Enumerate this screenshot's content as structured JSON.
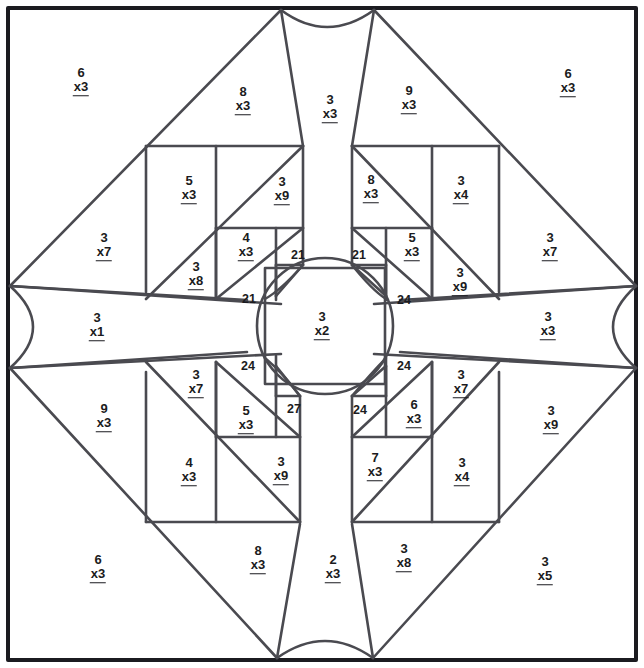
{
  "worksheet": {
    "title": "Multiplication Colour-by-Number Mosaic",
    "type": "color-by-number-puzzle",
    "canvas": {
      "width": 644,
      "height": 668
    },
    "colors": {
      "line": "#4a4a50",
      "border": "#1b1b20",
      "text": "#1b1b20",
      "background": "#ffffff"
    }
  },
  "regions": [
    {
      "id": "r01",
      "name": "top-left-corner-triangle",
      "top": "6",
      "bottom": "x3",
      "x": 81,
      "y": 81
    },
    {
      "id": "r02",
      "name": "top-left-inner-triangle",
      "top": "8",
      "bottom": "x3",
      "x": 243,
      "y": 100
    },
    {
      "id": "r03",
      "name": "top-center-left-petal",
      "top": "3",
      "bottom": "x3",
      "x": 330,
      "y": 108
    },
    {
      "id": "r04",
      "name": "top-right-inner-triangle",
      "top": "9",
      "bottom": "x3",
      "x": 409,
      "y": 99
    },
    {
      "id": "r05",
      "name": "top-right-corner-triangle",
      "top": "6",
      "bottom": "x3",
      "x": 568,
      "y": 82
    },
    {
      "id": "r06",
      "name": "upper-left-square-large",
      "top": "5",
      "bottom": "x3",
      "x": 189,
      "y": 189
    },
    {
      "id": "r07",
      "name": "upper-left-diag-strip",
      "top": "3",
      "bottom": "x9",
      "x": 282,
      "y": 190
    },
    {
      "id": "r08",
      "name": "upper-right-strip",
      "top": "8",
      "bottom": "x3",
      "x": 371,
      "y": 188
    },
    {
      "id": "r09",
      "name": "upper-right-square-large",
      "top": "3",
      "bottom": "x4",
      "x": 461,
      "y": 189
    },
    {
      "id": "r10",
      "name": "left-outer-triangle",
      "top": "3",
      "bottom": "x7",
      "x": 104,
      "y": 246
    },
    {
      "id": "r11",
      "name": "upper-left-square-mid",
      "top": "4",
      "bottom": "x3",
      "x": 246,
      "y": 246
    },
    {
      "id": "r12",
      "name": "upper-left-triangle-small",
      "top": "3",
      "bottom": "x8",
      "x": 196,
      "y": 275
    },
    {
      "id": "r13",
      "name": "upper-right-square-mid",
      "top": "5",
      "bottom": "x3",
      "x": 412,
      "y": 246
    },
    {
      "id": "r14",
      "name": "right-outer-triangle",
      "top": "3",
      "bottom": "x7",
      "x": 550,
      "y": 246
    },
    {
      "id": "r15",
      "name": "upper-right-triangle-small",
      "top": "3",
      "bottom": "x9",
      "x": 460,
      "y": 281
    },
    {
      "id": "r16",
      "name": "left-half-circle-band",
      "top": "3",
      "bottom": "x1",
      "x": 97,
      "y": 326
    },
    {
      "id": "r17",
      "name": "center-circle",
      "top": "3",
      "bottom": "x2",
      "x": 322,
      "y": 325
    },
    {
      "id": "r18",
      "name": "right-half-circle-band",
      "top": "3",
      "bottom": "x3",
      "x": 548,
      "y": 325
    },
    {
      "id": "r19",
      "name": "lower-left-triangle-small",
      "top": "3",
      "bottom": "x7",
      "x": 196,
      "y": 383
    },
    {
      "id": "r20",
      "name": "lower-right-triangle-small",
      "top": "3",
      "bottom": "x7",
      "x": 461,
      "y": 383
    },
    {
      "id": "r21",
      "name": "lower-left-square-mid",
      "top": "5",
      "bottom": "x3",
      "x": 246,
      "y": 419
    },
    {
      "id": "r22",
      "name": "lower-right-square-mid",
      "top": "6",
      "bottom": "x3",
      "x": 414,
      "y": 413
    },
    {
      "id": "r23",
      "name": "lower-left-outer-triangle",
      "top": "9",
      "bottom": "x3",
      "x": 104,
      "y": 417
    },
    {
      "id": "r24",
      "name": "lower-right-outer-strip",
      "top": "3",
      "bottom": "x9",
      "x": 551,
      "y": 419
    },
    {
      "id": "r25",
      "name": "lower-left-square-large",
      "top": "4",
      "bottom": "x3",
      "x": 189,
      "y": 471
    },
    {
      "id": "r26",
      "name": "lower-left-diag-strip",
      "top": "3",
      "bottom": "x9",
      "x": 281,
      "y": 470
    },
    {
      "id": "r27",
      "name": "lower-right-strip",
      "top": "7",
      "bottom": "x3",
      "x": 375,
      "y": 466
    },
    {
      "id": "r28",
      "name": "lower-right-square-large",
      "top": "3",
      "bottom": "x4",
      "x": 462,
      "y": 471
    },
    {
      "id": "r29",
      "name": "bottom-left-corner-triangle",
      "top": "6",
      "bottom": "x3",
      "x": 98,
      "y": 568
    },
    {
      "id": "r30",
      "name": "bottom-left-inner-triangle",
      "top": "8",
      "bottom": "x3",
      "x": 258,
      "y": 559
    },
    {
      "id": "r31",
      "name": "bottom-center-petal",
      "top": "2",
      "bottom": "x3",
      "x": 333,
      "y": 568
    },
    {
      "id": "r32",
      "name": "bottom-right-inner-triangle",
      "top": "3",
      "bottom": "x8",
      "x": 404,
      "y": 557
    },
    {
      "id": "r33",
      "name": "bottom-right-corner-triangle",
      "top": "3",
      "bottom": "x5",
      "x": 545,
      "y": 570
    }
  ],
  "product_regions": [
    {
      "id": "p01",
      "name": "answer-21-upper-left-a",
      "value": "21",
      "x": 298,
      "y": 255
    },
    {
      "id": "p02",
      "name": "answer-21-upper-right-a",
      "value": "21",
      "x": 359,
      "y": 255
    },
    {
      "id": "p03",
      "name": "answer-21-upper-left-b",
      "value": "21",
      "x": 249,
      "y": 299
    },
    {
      "id": "p04",
      "name": "answer-24-upper-right-b",
      "value": "24",
      "x": 404,
      "y": 300
    },
    {
      "id": "p05",
      "name": "answer-24-lower-left-a",
      "value": "24",
      "x": 248,
      "y": 366
    },
    {
      "id": "p06",
      "name": "answer-24-lower-right-a",
      "value": "24",
      "x": 404,
      "y": 366
    },
    {
      "id": "p07",
      "name": "answer-27-lower-left-b",
      "value": "27",
      "x": 294,
      "y": 409
    },
    {
      "id": "p08",
      "name": "answer-24-lower-right-b",
      "value": "24",
      "x": 360,
      "y": 410
    }
  ]
}
